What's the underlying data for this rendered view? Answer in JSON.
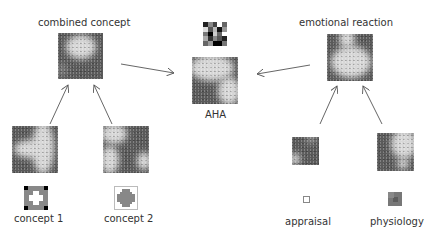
{
  "nodes": {
    "combined_concept": {
      "label": "combined concept"
    },
    "aha": {
      "label": "AHA"
    },
    "emotional_reaction": {
      "label": "emotional reaction"
    },
    "concept1": {
      "label": "concept 1"
    },
    "concept2": {
      "label": "concept 2"
    },
    "appraisal": {
      "label": "appraisal"
    },
    "physiology": {
      "label": "physiology"
    }
  },
  "edges": [
    {
      "from": "concept 1",
      "to": "combined concept"
    },
    {
      "from": "concept 2",
      "to": "combined concept"
    },
    {
      "from": "combined concept",
      "to": "AHA"
    },
    {
      "from": "emotional reaction",
      "to": "AHA"
    },
    {
      "from": "appraisal",
      "to": "emotional reaction"
    },
    {
      "from": "physiology",
      "to": "emotional reaction"
    }
  ],
  "colors": {
    "dark": "#5a5a5a",
    "light": "#d8d8d8",
    "arrow": "#555555"
  }
}
